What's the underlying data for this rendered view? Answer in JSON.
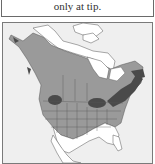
{
  "caption": {
    "text": "only at tip."
  },
  "map": {
    "title": "Range map of North America",
    "colors": {
      "background": "#efefef",
      "land_outside_range": "#ffffff",
      "range": "#9a9a9a",
      "breeding": "#4a4a4a",
      "borders": "#555555"
    }
  }
}
